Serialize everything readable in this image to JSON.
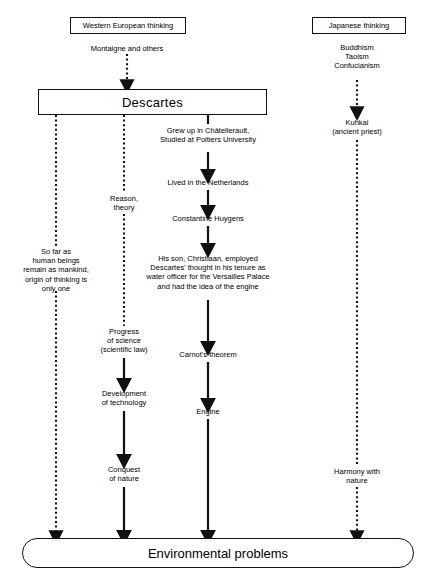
{
  "diagram": {
    "boxes": {
      "western": "Western European thinking",
      "japanese": "Japanese thinking",
      "descartes": "Descartes",
      "final": "Environmental problems"
    },
    "nodes": {
      "montaigne": "Montaigne and others",
      "eastern_roots": "Buddhism\nTaoism\nConfucianism",
      "kuhkai": "Kuhkai\n(ancient priest)",
      "harmony": "Harmony with\nnature",
      "origin": "So far as\nhuman beings\nremain as mankind,\norigin of thinking is\nonly one",
      "reason": "Reason,\ntheory",
      "progress": "Progress\nof science\n(scientific law)",
      "development": "Development\nof technology",
      "conquest": "Conquest\nof nature",
      "grewup": "Grew up in Châtellerault,\nStudied at Poitiers University",
      "netherlands": "Lived in the Netherlands",
      "huygens": "Constantine Huygens",
      "christiaan": "His son, Christiaan, employed\nDescartes' thought in his tenure as\nwater officer for the Versailles Palace\nand had the idea of the engine",
      "carnot": "Carnot's theorem",
      "engine": "Engine"
    },
    "colors": {
      "stroke": "#111111",
      "background": "#ffffff"
    }
  }
}
